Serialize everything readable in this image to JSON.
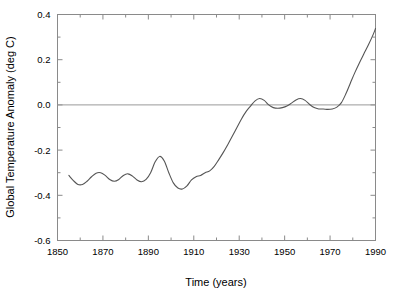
{
  "chart_data": {
    "type": "line",
    "title": "",
    "xlabel": "Time (years)",
    "ylabel": "Global Temperature Anomaly (deg C)",
    "xlim": [
      1850,
      1990
    ],
    "ylim": [
      -0.6,
      0.4
    ],
    "grid": false,
    "legend": "none",
    "zero_line": 0.0,
    "x_ticks": [
      1850,
      1870,
      1890,
      1910,
      1930,
      1950,
      1970,
      1990
    ],
    "x_tick_labels": [
      "1850",
      "1870",
      "1890",
      "1910",
      "1930",
      "1950",
      "1970",
      "1990"
    ],
    "x_minor_ticks": [
      1860,
      1880,
      1900,
      1920,
      1940,
      1960,
      1980
    ],
    "y_ticks": [
      -0.6,
      -0.4,
      -0.2,
      0.0,
      0.2,
      0.4
    ],
    "y_tick_labels": [
      "-0.6",
      "-0.4",
      "-0.2",
      "0.0",
      "0.2",
      "0.4"
    ],
    "y_minor_ticks": [
      -0.5,
      -0.3,
      -0.1,
      0.1,
      0.3
    ],
    "line_color": "#555555",
    "series": [
      {
        "name": "Global Temperature Anomaly",
        "x": [
          1855,
          1857,
          1859,
          1861,
          1863,
          1865,
          1867,
          1869,
          1871,
          1873,
          1875,
          1877,
          1879,
          1881,
          1883,
          1885,
          1887,
          1889,
          1891,
          1893,
          1895,
          1897,
          1899,
          1901,
          1903,
          1905,
          1907,
          1909,
          1911,
          1913,
          1915,
          1917,
          1919,
          1921,
          1923,
          1925,
          1927,
          1929,
          1931,
          1933,
          1935,
          1937,
          1939,
          1941,
          1943,
          1945,
          1947,
          1949,
          1951,
          1953,
          1955,
          1957,
          1959,
          1961,
          1963,
          1965,
          1967,
          1969,
          1971,
          1973,
          1975,
          1977,
          1979,
          1981,
          1983,
          1985,
          1987,
          1989,
          1990
        ],
        "y": [
          -0.312,
          -0.335,
          -0.352,
          -0.352,
          -0.338,
          -0.318,
          -0.302,
          -0.3,
          -0.312,
          -0.33,
          -0.338,
          -0.33,
          -0.312,
          -0.305,
          -0.315,
          -0.332,
          -0.34,
          -0.33,
          -0.3,
          -0.252,
          -0.228,
          -0.248,
          -0.3,
          -0.345,
          -0.368,
          -0.372,
          -0.358,
          -0.332,
          -0.318,
          -0.312,
          -0.3,
          -0.292,
          -0.272,
          -0.242,
          -0.21,
          -0.175,
          -0.138,
          -0.1,
          -0.062,
          -0.03,
          -0.005,
          0.018,
          0.028,
          0.02,
          0.0,
          -0.012,
          -0.015,
          -0.012,
          -0.005,
          0.008,
          0.022,
          0.028,
          0.02,
          0.002,
          -0.012,
          -0.018,
          -0.018,
          -0.02,
          -0.018,
          -0.01,
          0.01,
          0.05,
          0.098,
          0.145,
          0.188,
          0.228,
          0.268,
          0.312,
          0.338
        ]
      }
    ]
  },
  "axes": {
    "x_title": "Time (years)",
    "y_title": "Global Temperature Anomaly (deg C)"
  }
}
